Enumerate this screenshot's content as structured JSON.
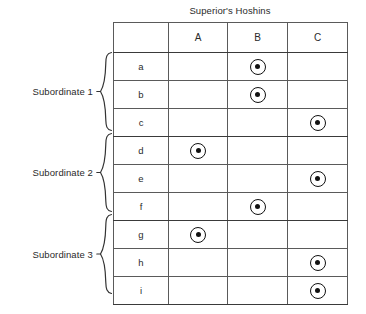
{
  "chart_data": {
    "type": "table",
    "title": "Superior's Hoshins",
    "xlabel": "",
    "ylabel": "",
    "columns": [
      "",
      "A",
      "B",
      "C"
    ],
    "categories": [
      "A",
      "B",
      "C"
    ],
    "rows": [
      {
        "label": "a",
        "group": "Subordinate 1",
        "marks": [
          "",
          "◉",
          ""
        ]
      },
      {
        "label": "b",
        "group": "Subordinate 1",
        "marks": [
          "",
          "◉",
          ""
        ]
      },
      {
        "label": "c",
        "group": "Subordinate 1",
        "marks": [
          "",
          "",
          "◉"
        ]
      },
      {
        "label": "d",
        "group": "Subordinate 2",
        "marks": [
          "◉",
          "",
          ""
        ]
      },
      {
        "label": "e",
        "group": "Subordinate 2",
        "marks": [
          "",
          "",
          "◉"
        ]
      },
      {
        "label": "f",
        "group": "Subordinate 2",
        "marks": [
          "",
          "◉",
          ""
        ]
      },
      {
        "label": "g",
        "group": "Subordinate 3",
        "marks": [
          "◉",
          "",
          ""
        ]
      },
      {
        "label": "h",
        "group": "Subordinate 3",
        "marks": [
          "",
          "",
          "◉"
        ]
      },
      {
        "label": "i",
        "group": "Subordinate 3",
        "marks": [
          "",
          "",
          "◉"
        ]
      }
    ],
    "legend": [],
    "annotations": [
      "Subordinate 1",
      "Subordinate 2",
      "Subordinate 3"
    ],
    "grid": true
  },
  "title": "Superior's Hoshins",
  "table": {
    "header": {
      "corner": "",
      "col_a": "A",
      "col_b": "B",
      "col_c": "C"
    },
    "row_labels": [
      "a",
      "b",
      "c",
      "d",
      "e",
      "f",
      "g",
      "h",
      "i"
    ],
    "cells": [
      [
        "",
        "◉",
        ""
      ],
      [
        "",
        "◉",
        ""
      ],
      [
        "",
        "",
        "◉"
      ],
      [
        "◉",
        "",
        ""
      ],
      [
        "",
        "",
        "◉"
      ],
      [
        "",
        "◉",
        ""
      ],
      [
        "◉",
        "",
        ""
      ],
      [
        "",
        "",
        "◉"
      ],
      [
        "",
        "",
        "◉"
      ]
    ]
  },
  "groups": [
    {
      "label": "Subordinate 1",
      "rows": [
        "a",
        "b",
        "c"
      ]
    },
    {
      "label": "Subordinate 2",
      "rows": [
        "d",
        "e",
        "f"
      ]
    },
    {
      "label": "Subordinate 3",
      "rows": [
        "g",
        "h",
        "i"
      ]
    }
  ],
  "colors": {
    "ink": "#1a1a1a",
    "border_outer": "#2b2b2b",
    "border_inner": "#5a5a5a",
    "background": "#ffffff",
    "mark": "#111111"
  }
}
